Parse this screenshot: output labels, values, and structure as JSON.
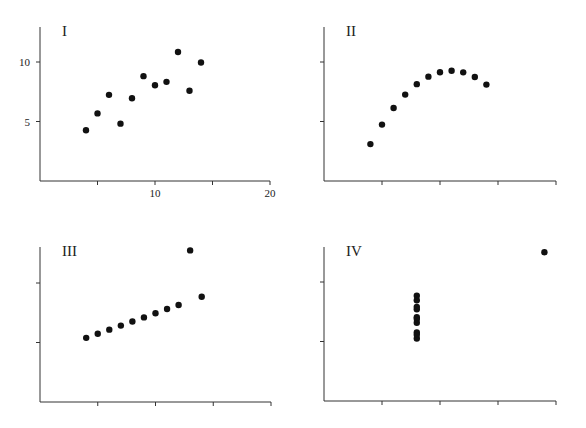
{
  "chart_data": [
    {
      "type": "scatter",
      "title": "I",
      "xlabel": "",
      "ylabel": "",
      "xlim": [
        0,
        20
      ],
      "ylim": [
        0,
        13
      ],
      "xticks": [
        5,
        10,
        15,
        20
      ],
      "xtick_labels": [
        "",
        "10",
        "",
        "20"
      ],
      "yticks": [
        5,
        10
      ],
      "ytick_labels": [
        "5",
        "10"
      ],
      "grid": false,
      "x": [
        10,
        8,
        13,
        9,
        11,
        14,
        6,
        4,
        12,
        7,
        5
      ],
      "y": [
        8.04,
        6.95,
        7.58,
        8.81,
        8.33,
        9.96,
        7.24,
        4.26,
        10.84,
        4.82,
        5.68
      ]
    },
    {
      "type": "scatter",
      "title": "II",
      "xlabel": "",
      "ylabel": "",
      "xlim": [
        0,
        20
      ],
      "ylim": [
        0,
        13
      ],
      "xticks": [
        5,
        10,
        15,
        20
      ],
      "xtick_labels": [
        "",
        "",
        "",
        ""
      ],
      "yticks": [
        5,
        10
      ],
      "ytick_labels": [
        "",
        ""
      ],
      "grid": false,
      "x": [
        10,
        8,
        13,
        9,
        11,
        14,
        6,
        4,
        12,
        7,
        5
      ],
      "y": [
        9.14,
        8.14,
        8.74,
        8.77,
        9.26,
        8.1,
        6.13,
        3.1,
        9.13,
        7.26,
        4.74
      ]
    },
    {
      "type": "scatter",
      "title": "III",
      "xlabel": "",
      "ylabel": "",
      "xlim": [
        0,
        20
      ],
      "ylim": [
        0,
        13
      ],
      "xticks": [
        5,
        10,
        15,
        20
      ],
      "xtick_labels": [
        "",
        "",
        "",
        ""
      ],
      "yticks": [
        5,
        10
      ],
      "ytick_labels": [
        "",
        ""
      ],
      "grid": false,
      "x": [
        10,
        8,
        13,
        9,
        11,
        14,
        6,
        4,
        12,
        7,
        5
      ],
      "y": [
        7.46,
        6.77,
        12.74,
        7.11,
        7.81,
        8.84,
        6.08,
        5.39,
        8.15,
        6.42,
        5.73
      ]
    },
    {
      "type": "scatter",
      "title": "IV",
      "xlabel": "",
      "ylabel": "",
      "xlim": [
        0,
        20
      ],
      "ylim": [
        0,
        13
      ],
      "xticks": [
        5,
        10,
        15,
        20
      ],
      "xtick_labels": [
        "",
        "",
        "",
        ""
      ],
      "yticks": [
        5,
        10
      ],
      "ytick_labels": [
        "",
        ""
      ],
      "grid": false,
      "x": [
        8,
        8,
        8,
        8,
        8,
        8,
        8,
        19,
        8,
        8,
        8
      ],
      "y": [
        6.58,
        5.76,
        7.71,
        8.84,
        8.47,
        7.04,
        5.25,
        12.5,
        5.56,
        7.91,
        6.89
      ]
    }
  ],
  "panels": [
    {
      "title": "I"
    },
    {
      "title": "II"
    },
    {
      "title": "III"
    },
    {
      "title": "IV"
    }
  ]
}
